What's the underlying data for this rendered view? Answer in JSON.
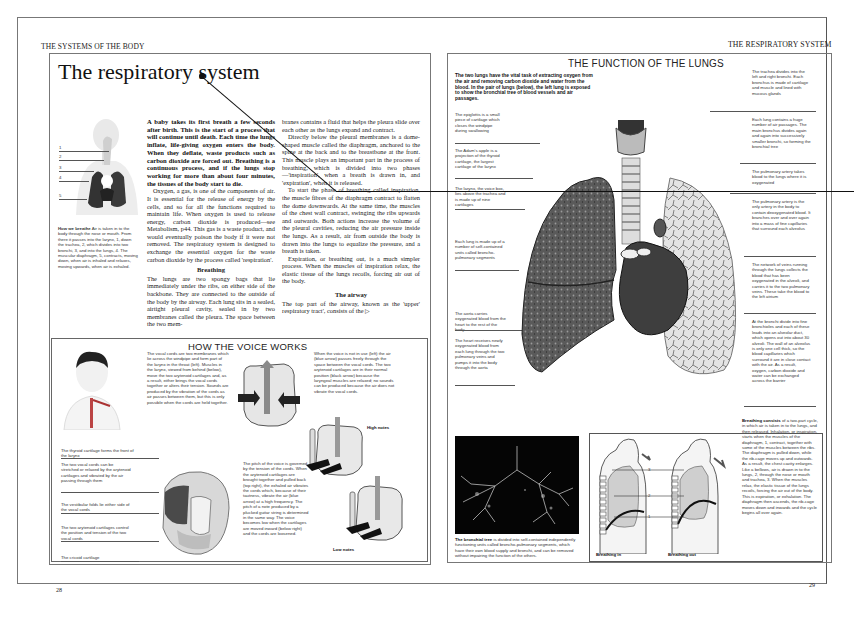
{
  "spread": {
    "left_running_head": "THE SYSTEMS OF THE BODY",
    "right_running_head": "THE RESPIRATORY SYSTEM",
    "left_page_number": "28",
    "right_page_number": "29"
  },
  "left_page": {
    "title": "The respiratory system",
    "figure_how_we_breathe": {
      "labels": [
        "1",
        "2",
        "3",
        "4",
        "5"
      ],
      "caption_lead": "How we breathe",
      "caption": "Air is taken in to the body through the nose or mouth. From there it passes into the larynx, 1, down the trachea, 2, which divides into two bronchi, 3, and into the lungs, 4. The muscular diaphragm, 5, contracts, moving down, when air is inhaled and relaxes, moving upwards, when air is exhaled."
    },
    "intro_bold": "A baby takes its first breath a few seconds after birth. This is the start of a process that will continue until death. Each time the lungs inflate, life-giving oxygen enters the body. When they deflate, waste products such as carbon dioxide are forced out. Breathing is a continuous process, and if the lungs stop working for more than about four minutes, the tissues of the body start to die.",
    "para_oxygen": "Oxygen, a gas, is one of the components of air. It is essential for the release of energy by the cells, and so for all the functions required to maintain life. When oxygen is used to release energy, carbon dioxide is produced—see Metabolism, p44. This gas is a waste product, and would eventually poison the body if it were not removed. The respiratory system is designed to exchange the essential oxygen for the waste carbon dioxide by the process called 'respiration'.",
    "subhead_breathing": "Breathing",
    "para_breathing": "The lungs are two spongy bags that lie immediately under the ribs, on either side of the backbone. They are connected to the outside of the body by the airway. Each lung sits in a sealed, airtight pleural cavity, sealed in by two membranes called the pleura. The space between the two mem-",
    "col2_para1": "branes contains a fluid that helps the pleura slide over each other as the lungs expand and contract.",
    "col2_para2": "Directly below the pleural membranes is a dome-shaped muscle called the diaphragm, anchored to the spine at the back and to the breastbone at the front. This muscle plays an important part in the process of breathing, which is divided into two phases—'inspiration', when a breath is drawn in, and 'expiration', when it is released.",
    "col2_para3": "To start the phase of breathing called inspiration, the muscle fibres of the diaphragm contract to flatten the dome downwards. At the same time, the muscles of the chest wall contract, swinging the ribs upwards and outwards. Both actions increase the volume of the pleural cavities, reducing the air pressure inside the lungs. As a result, air from outside the body is drawn into the lungs to equalize the pressure, and a breath is taken.",
    "col2_para4": "Expiration, or breathing out, is a much simpler process. When the muscles of inspiration relax, the elastic tissue of the lungs recoils, forcing air out of the body.",
    "subhead_airway": "The airway",
    "para_airway": "The top part of the airway, known as the 'upper' respiratory tract', consists of the ▷",
    "voice_box": {
      "heading": "HOW THE VOICE WORKS",
      "text_vocal_cords": "The vocal cords are two membranes which lie across the windpipe and form part of the larynx in the throat (left). Muscles in the larynx, viewed from behind (below), move the two arytenoid cartilages and, as a result, either brings the vocal cords together or alters their tension. Sounds are produced by the vibration of the cords as air passes between them, but this is only possible when the cords are held together.",
      "text_not_in_use": "When the voice is not in use (left) the air (blue arrow) passes freely through the space between the vocal cords. The two arytenoid cartilages are in their normal position (black arrow) because the laryngeal muscles are relaxed; no sounds can be produced because the air does not vibrate the vocal cords.",
      "text_pitch": "The pitch of the voice is governed by the tension of the cords. When the arytenoid cartilages are brought together and pulled back (top right), the exhaled air vibrates the cords which, because of their tautness, vibrate the air (blue arrow) at a high frequency. The pitch of a note produced by a plucked guitar string is determined in the same way. The voice becomes low when the cartilages are moved inward (below right) and the cords are loosened.",
      "label_high_notes": "High notes",
      "label_low_notes": "Low notes",
      "callouts": [
        "The thyroid cartilage forms the front of the larynx",
        "The two vocal cords can be stretched or relaxed by the arytenoid cartilages and vibrated by the air passing through them",
        "The vestibular folds lie either side of the vocal cords",
        "The two arytenoid cartilages control the position and tension of the two vocal cords",
        "The cricoid cartilage"
      ]
    }
  },
  "right_page": {
    "heading": "THE FUNCTION OF THE LUNGS",
    "intro_bold": "The two lungs have the vital task of extracting oxygen from the air and removing carbon dioxide and water from the blood. In the pair of lungs (below), the left lung is exposed to show the bronchial tree of blood vessels and air passages.",
    "left_callouts": [
      "The epiglottis is a small piece of cartilage which closes the windpipe during swallowing",
      "The Adam's apple is a projection of the thyroid cartilage, the largest cartilage of the larynx",
      "The larynx, the voice box, lies above the trachea and is made up of nine cartilages",
      "Each lung is made up of a number of self-contained units called broncho-pulmonary segments",
      "The aorta carries oxygenated blood from the heart to the rest of the body",
      "The heart receives newly oxygenated blood from each lung through the two pulmonary veins and pumps it into the body through the aorta"
    ],
    "right_callouts": [
      "The trachea divides into the left and right bronchi. Each bronchus is made of cartilage and muscle and lined with mucous glands",
      "Each lung contains a huge number of air passages. The main bronchus divides again and again into successively smaller bronchi, so forming the bronchial tree",
      "The pulmonary artery takes blood to the lungs where it is oxygenated",
      "The pulmonary artery is the only artery in the body to contain deoxygenated blood. It branches over and over again into a mass of fine capillaries that surround each alveolus",
      "The network of veins running through the lungs collects the blood that has been oxygenated in the alveoli, and carries it to the two pulmonary veins. These take the blood to the left atrium",
      "At the bronchi divide into fine bronchioles and each of these leads into an alveolar duct, which opens out into about 30 alveoli. The wall of an alveolus is only one cell thick, so the blood capillaries which surround it are in close contact with the air. As a result, oxygen, carbon dioxide and water can be exchanged across the barrier"
    ],
    "bronchial_tree": {
      "caption_lead": "The bronchial tree",
      "caption": "is divided into self-contained independently functioning units called broncho-pulmonary segments, which have their own blood supply and bronchi, and can be removed without impairing the function of the others."
    },
    "breathing_cycle": {
      "labels": [
        "3",
        "2",
        "1"
      ],
      "label_in": "Breathing in",
      "label_out": "Breathing out",
      "text_lead": "Breathing consists",
      "text": "of a two-part cycle, in which air is taken in to the lungs, and then released. Inhalation, or inspiration, starts when the muscles of the diaphragm, 1, contract, together with some of the muscles between the ribs. The diaphragm is pulled down, while the rib-cage moves up and outwards. As a result, the chest cavity enlarges. Like a bellows, air is drawn in to the lungs, 2, through the nose or mouth and trachea, 3. When the muscles relax, the elastic tissue of the lungs recoils, forcing the air out of the body. This is expiration, or exhalation. The diaphragm then ascends, the rib-cage moves down and inwards and the cycle begins all over again."
    }
  }
}
